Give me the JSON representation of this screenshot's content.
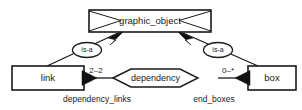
{
  "diagram": {
    "type": "entity-relationship-diagram",
    "title_shown": false,
    "colors": {
      "stroke": "#1a1a1a",
      "fill": "#ffffff",
      "arrow_fill": "#111111",
      "background": "#ffffff"
    },
    "entities": [
      {
        "id": "graphic_object",
        "label": "graphic_object",
        "shape": "notched-rectangle"
      },
      {
        "id": "link",
        "label": "link",
        "shape": "rectangle"
      },
      {
        "id": "box",
        "label": "box",
        "shape": "rectangle"
      }
    ],
    "relationships": [
      {
        "id": "dependency",
        "label": "dependency",
        "shape": "hexagon-diamond"
      }
    ],
    "isa_nodes": [
      {
        "id": "isa_left",
        "label": "is-a",
        "shape": "ellipse"
      },
      {
        "id": "isa_right",
        "label": "is-a",
        "shape": "ellipse"
      }
    ],
    "cardinalities": [
      {
        "id": "link_side",
        "label": "2–2"
      },
      {
        "id": "box_side",
        "label": "0–*"
      }
    ],
    "roles": [
      {
        "id": "dependency_links",
        "label": "dependency_links"
      },
      {
        "id": "end_boxes",
        "label": "end_boxes"
      }
    ],
    "edges": [
      {
        "from": "link",
        "via": "isa_left",
        "to": "graphic_object",
        "arrow": "filled-triangle-at-target"
      },
      {
        "from": "box",
        "via": "isa_right",
        "to": "graphic_object",
        "arrow": "filled-triangle-at-target"
      },
      {
        "from": "link",
        "to": "dependency",
        "arrow": "filled-triangle-at-source"
      },
      {
        "from": "box",
        "to": "dependency",
        "arrow": "filled-triangle-at-source"
      }
    ]
  }
}
